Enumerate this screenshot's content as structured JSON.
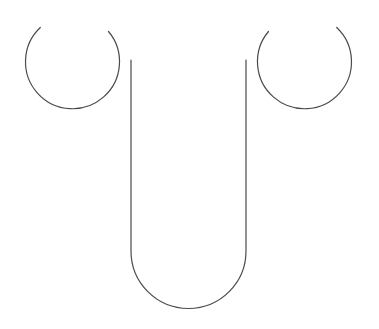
{
  "canvas": {
    "width": 379,
    "height": 329,
    "background_color": "#ffffff",
    "title": "abstract-line-drawing"
  },
  "style": {
    "stroke_color": "#4b4b4b",
    "stroke_width": 1.2,
    "fill": "none"
  },
  "figure": {
    "name": "bull-head-glyph",
    "parts": [
      {
        "name": "left-horn-circle",
        "type": "arc",
        "center_x": 77,
        "center_y": 65,
        "radius": 47,
        "start_angle_deg": -53,
        "sweep_deg": 303,
        "gap_location": "top-right",
        "path": "M 40.3 27.5 A 47 47 0 1 0 108.5 31.5"
      },
      {
        "name": "right-horn-circle",
        "type": "arc",
        "center_x": 300,
        "center_y": 65,
        "radius": 47,
        "start_angle_deg": 233,
        "sweep_deg": 303,
        "gap_location": "top-left",
        "path": "M 336.7 27.5 A 47 47 0 1 1 268.5 31.5"
      },
      {
        "name": "center-u-shape",
        "type": "u-path",
        "left_x": 131,
        "right_x": 246,
        "top_y": 60,
        "bottom_y": 308,
        "corner_radius": 57.5,
        "path": "M 131 60 L 131 251 A 57.5 57.5 0 0 0 246 251 L 246 60"
      }
    ]
  }
}
